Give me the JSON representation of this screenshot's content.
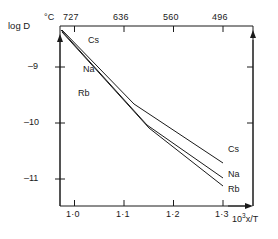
{
  "chart_data": {
    "type": "line",
    "title": "",
    "xlabel": "10³x/T",
    "ylabel": "log D",
    "top_axis_label": "°C",
    "xlim": [
      0.96,
      1.34
    ],
    "ylim": [
      -11.55,
      -8.35
    ],
    "grid": false,
    "legend": "inline-labels",
    "x_ticks": [
      {
        "value": 1.0,
        "label": "1·0"
      },
      {
        "value": 1.1,
        "label": "1·1"
      },
      {
        "value": 1.2,
        "label": "1·2"
      },
      {
        "value": 1.3,
        "label": "1·3"
      }
    ],
    "y_ticks": [
      {
        "value": -9,
        "label": "–9"
      },
      {
        "value": -10,
        "label": "–10"
      },
      {
        "value": -11,
        "label": "–11"
      }
    ],
    "top_ticks": [
      {
        "value": 1.0,
        "label": "727"
      },
      {
        "value": 1.1,
        "label": "636"
      },
      {
        "value": 1.2,
        "label": "560"
      },
      {
        "value": 1.3,
        "label": "496"
      }
    ],
    "series": [
      {
        "name": "Cs",
        "points": [
          {
            "x": 0.975,
            "y": -8.42
          },
          {
            "x": 1.148,
            "y": -9.74
          },
          {
            "x": 1.334,
            "y": -10.78
          }
        ],
        "label_left": "Cs",
        "label_right": "Cs"
      },
      {
        "name": "Na",
        "points": [
          {
            "x": 0.966,
            "y": -8.42
          },
          {
            "x": 1.176,
            "y": -10.12
          },
          {
            "x": 1.334,
            "y": -11.06
          }
        ],
        "label_left": "Na",
        "label_right": "Na"
      },
      {
        "name": "Rb",
        "points": [
          {
            "x": 0.969,
            "y": -8.46
          },
          {
            "x": 1.18,
            "y": -10.17
          },
          {
            "x": 1.334,
            "y": -11.2
          }
        ],
        "label_left": "Rb",
        "label_right": "Rb"
      }
    ]
  },
  "axes": {
    "y_axis_arrow": "up-arrow",
    "x_axis_arrow": "right-arrow",
    "right_axis_arrow": "up-arrow"
  }
}
